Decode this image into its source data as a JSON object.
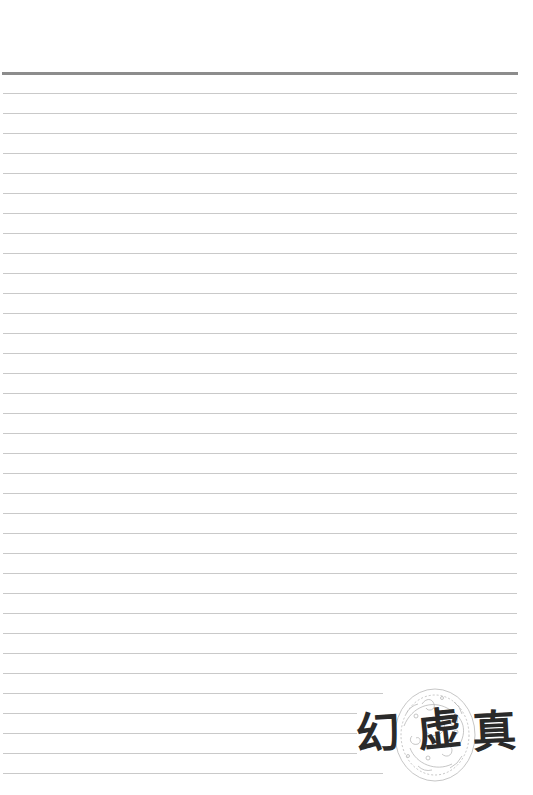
{
  "page": {
    "type": "lined-notebook-page",
    "background_color": "#ffffff",
    "header_rule": {
      "y": 73,
      "x_start": 2,
      "x_end": 518,
      "thickness": 3,
      "color": "#8c8c8c"
    },
    "rules": {
      "color": "#c9c9c9",
      "spacing": 20,
      "lines": [
        {
          "y": 93,
          "x_end": 517
        },
        {
          "y": 113,
          "x_end": 517
        },
        {
          "y": 133,
          "x_end": 517
        },
        {
          "y": 153,
          "x_end": 517
        },
        {
          "y": 173,
          "x_end": 517
        },
        {
          "y": 193,
          "x_end": 517
        },
        {
          "y": 213,
          "x_end": 517
        },
        {
          "y": 233,
          "x_end": 517
        },
        {
          "y": 253,
          "x_end": 517
        },
        {
          "y": 273,
          "x_end": 517
        },
        {
          "y": 293,
          "x_end": 517
        },
        {
          "y": 313,
          "x_end": 517
        },
        {
          "y": 333,
          "x_end": 517
        },
        {
          "y": 353,
          "x_end": 517
        },
        {
          "y": 373,
          "x_end": 517
        },
        {
          "y": 393,
          "x_end": 517
        },
        {
          "y": 413,
          "x_end": 517
        },
        {
          "y": 433,
          "x_end": 517
        },
        {
          "y": 453,
          "x_end": 517
        },
        {
          "y": 473,
          "x_end": 517
        },
        {
          "y": 493,
          "x_end": 517
        },
        {
          "y": 513,
          "x_end": 517
        },
        {
          "y": 533,
          "x_end": 517
        },
        {
          "y": 553,
          "x_end": 517
        },
        {
          "y": 573,
          "x_end": 517
        },
        {
          "y": 593,
          "x_end": 517
        },
        {
          "y": 613,
          "x_end": 517
        },
        {
          "y": 633,
          "x_end": 517
        },
        {
          "y": 653,
          "x_end": 517
        },
        {
          "y": 673,
          "x_end": 517
        },
        {
          "y": 693,
          "x_end": 383
        },
        {
          "y": 713,
          "x_end": 357
        },
        {
          "y": 733,
          "x_end": 357
        },
        {
          "y": 753,
          "x_end": 357
        },
        {
          "y": 773,
          "x_end": 383
        }
      ]
    }
  },
  "stamp": {
    "icon": "ornamental-dragon-medallion-icon",
    "calligraphy": {
      "text": "幻虚真",
      "chars": [
        "幻",
        "虚",
        "真"
      ]
    },
    "ink_color": "#2a2a2a",
    "ornament_color": "#b8b8b8"
  }
}
